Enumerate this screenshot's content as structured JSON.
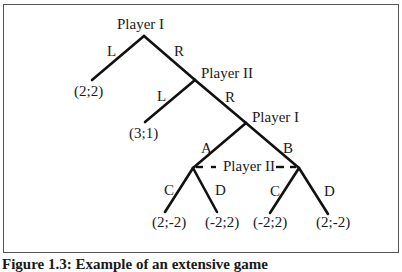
{
  "diagram": {
    "type": "extensive-form game tree",
    "nodes": {
      "root": {
        "label": "Player I"
      },
      "n2": {
        "label": "Player II"
      },
      "n3": {
        "label": "Player I"
      },
      "info_set": {
        "label": "Player II"
      }
    },
    "edges": {
      "root_L": "L",
      "root_R": "R",
      "n2_L": "L",
      "n2_R": "R",
      "n3_A": "A",
      "n3_B": "B",
      "a_C": "C",
      "a_D": "D",
      "b_C": "C",
      "b_D": "D"
    },
    "payoffs": {
      "p1": "(2;2)",
      "p2": "(3;1)",
      "p3": "(2;-2)",
      "p4": "(-2;2)",
      "p5": "(-2;2)",
      "p6": "(2;-2)"
    },
    "caption": "Figure 1.3: Example of an extensive game"
  }
}
